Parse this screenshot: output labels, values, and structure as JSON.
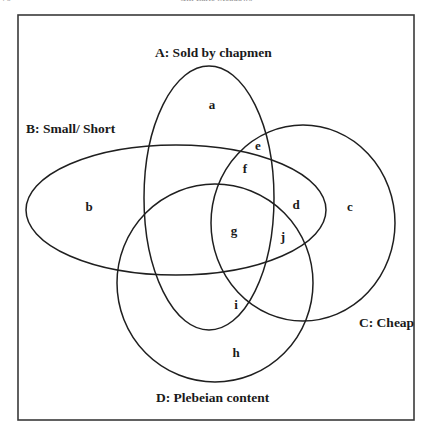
{
  "page": {
    "number": "70",
    "running_head": "Gill Earle Meadows"
  },
  "diagram": {
    "type": "venn",
    "sets": [
      {
        "id": "A",
        "label": "A: Sold by chapmen",
        "shape": {
          "cx": 209,
          "cy": 198,
          "rx": 65,
          "ry": 132
        }
      },
      {
        "id": "B",
        "label": "B: Small/ Short",
        "shape": {
          "cx": 176,
          "cy": 210,
          "rx": 150,
          "ry": 65
        }
      },
      {
        "id": "C",
        "label": "C: Cheap",
        "shape": {
          "cx": 303,
          "cy": 223,
          "rx": 92,
          "ry": 98
        }
      },
      {
        "id": "D",
        "label": "D: Plebeian content",
        "shape": {
          "cx": 215,
          "cy": 283,
          "rx": 98,
          "ry": 99
        }
      }
    ],
    "regions": [
      {
        "id": "a",
        "label": "a",
        "x": 212,
        "y": 109
      },
      {
        "id": "b",
        "label": "b",
        "x": 89,
        "y": 211
      },
      {
        "id": "c",
        "label": "c",
        "x": 350,
        "y": 211
      },
      {
        "id": "d",
        "label": "d",
        "x": 296,
        "y": 209
      },
      {
        "id": "e",
        "label": "e",
        "x": 258,
        "y": 150
      },
      {
        "id": "f",
        "label": "f",
        "x": 245,
        "y": 173
      },
      {
        "id": "g",
        "label": "g",
        "x": 234,
        "y": 235
      },
      {
        "id": "h",
        "label": "h",
        "x": 236,
        "y": 357
      },
      {
        "id": "i",
        "label": "i",
        "x": 236,
        "y": 309
      },
      {
        "id": "j",
        "label": "j",
        "x": 283,
        "y": 241
      }
    ],
    "label_positions": {
      "A": {
        "x": 155,
        "y": 57
      },
      "B": {
        "x": 26,
        "y": 133
      },
      "C": {
        "x": 359,
        "y": 327
      },
      "D": {
        "x": 156,
        "y": 402
      }
    }
  }
}
